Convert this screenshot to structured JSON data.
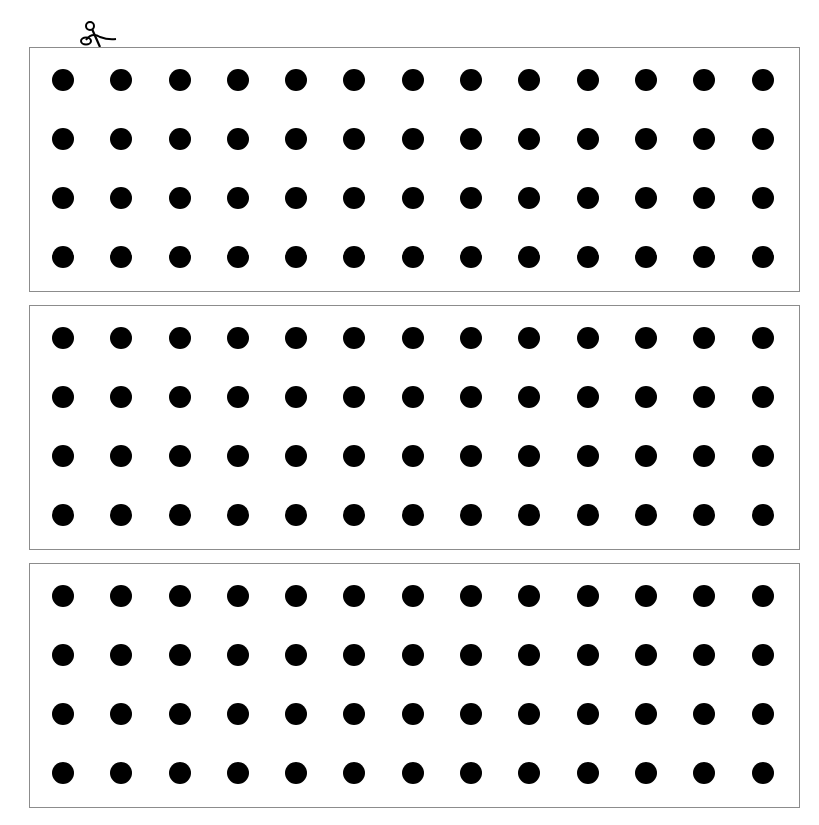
{
  "page": {
    "cut_marker": "scissors-icon",
    "panels": [
      {
        "rows": 4,
        "cols": 13
      },
      {
        "rows": 4,
        "cols": 13
      },
      {
        "rows": 4,
        "cols": 13
      }
    ],
    "dot_color": "#000000",
    "border_color": "#8c8c8c"
  }
}
